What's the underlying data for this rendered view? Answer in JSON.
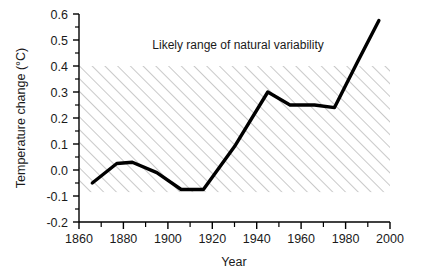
{
  "chart_data": {
    "type": "line",
    "title": "",
    "xlabel": "Year",
    "ylabel": "Temperature change (°C)",
    "xlim": [
      1860,
      2000
    ],
    "ylim": [
      -0.2,
      0.6
    ],
    "grid": false,
    "legend": "none",
    "x_ticks": [
      1860,
      1880,
      1900,
      1920,
      1940,
      1960,
      1980,
      2000
    ],
    "x_tick_labels": [
      "1860",
      "1880",
      "1900",
      "1920",
      "1940",
      "1960",
      "1980",
      "2000"
    ],
    "x_minor_ticks": [
      1870,
      1890,
      1910,
      1930,
      1950,
      1970,
      1990
    ],
    "y_ticks": [
      -0.2,
      -0.1,
      0.0,
      0.1,
      0.2,
      0.3,
      0.4,
      0.5,
      0.6
    ],
    "y_tick_labels": [
      "-0.2",
      "-0.1",
      "0.0",
      "0.1",
      "0.2",
      "0.3",
      "0.4",
      "0.5",
      "0.6"
    ],
    "series": [
      {
        "name": "Temperature change",
        "color": "#000000",
        "x": [
          1866,
          1877,
          1884,
          1895,
          1906,
          1916,
          1930,
          1945,
          1955,
          1966,
          1975,
          1985,
          1995
        ],
        "values": [
          -0.05,
          0.025,
          0.03,
          -0.01,
          -0.075,
          -0.075,
          0.09,
          0.3,
          0.25,
          0.25,
          0.24,
          0.41,
          0.575
        ]
      }
    ],
    "bands": [
      {
        "name": "Likely range of natural variability",
        "label": "Likely range of natural variability",
        "y_min": -0.085,
        "y_max": 0.4,
        "x_min": 1860,
        "x_max": 2000,
        "fill": "hatched",
        "hatch_color": "#9a9a9a",
        "background": "#ffffff"
      }
    ],
    "annotations": [
      {
        "text": "Likely range of natural variability",
        "x": 1893,
        "y": 0.465
      }
    ]
  },
  "axes": {
    "x_axis_title": "Year",
    "y_axis_title": "Temperature change (°C)"
  }
}
